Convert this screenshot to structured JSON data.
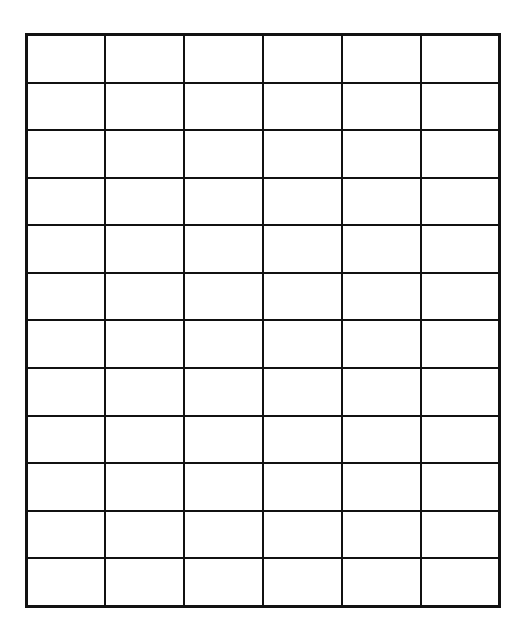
{
  "grid": {
    "columns": 6,
    "rows": 12,
    "cells": [
      [
        "",
        "",
        "",
        "",
        "",
        ""
      ],
      [
        "",
        "",
        "",
        "",
        "",
        ""
      ],
      [
        "",
        "",
        "",
        "",
        "",
        ""
      ],
      [
        "",
        "",
        "",
        "",
        "",
        ""
      ],
      [
        "",
        "",
        "",
        "",
        "",
        ""
      ],
      [
        "",
        "",
        "",
        "",
        "",
        ""
      ],
      [
        "",
        "",
        "",
        "",
        "",
        ""
      ],
      [
        "",
        "",
        "",
        "",
        "",
        ""
      ],
      [
        "",
        "",
        "",
        "",
        "",
        ""
      ],
      [
        "",
        "",
        "",
        "",
        "",
        ""
      ],
      [
        "",
        "",
        "",
        "",
        "",
        ""
      ],
      [
        "",
        "",
        "",
        "",
        "",
        ""
      ]
    ],
    "line_color": "#111111",
    "background": "#ffffff"
  }
}
